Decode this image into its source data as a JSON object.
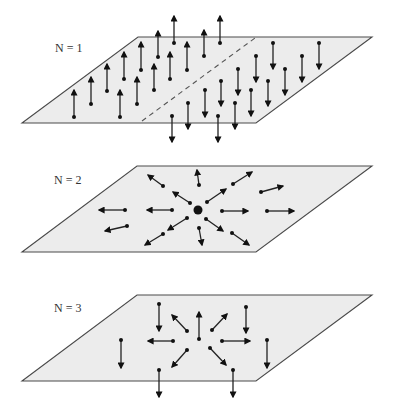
{
  "figure": {
    "colors": {
      "plane_fill": "#ececec",
      "plane_edge": "#4a4a4a",
      "arrow": "#222222",
      "background": "#ffffff"
    },
    "panels": [
      {
        "id": "n1",
        "label": "N = 1",
        "label_pos": [
          55,
          52
        ],
        "plane": [
          [
            138,
            37
          ],
          [
            372,
            37
          ],
          [
            256,
            123
          ],
          [
            22,
            123
          ]
        ],
        "dashed_line": [
          [
            142,
            121
          ],
          [
            255,
            38
          ]
        ],
        "center_dot": null,
        "arrows": [
          [
            [
              74,
              117
            ],
            [
              74,
              90
            ]
          ],
          [
            [
              91,
              104
            ],
            [
              91,
              77
            ]
          ],
          [
            [
              107,
              91
            ],
            [
              107,
              64
            ]
          ],
          [
            [
              124,
              79
            ],
            [
              124,
              52
            ]
          ],
          [
            [
              120,
              117
            ],
            [
              120,
              90
            ]
          ],
          [
            [
              137,
              104
            ],
            [
              137,
              77
            ]
          ],
          [
            [
              141,
              70
            ],
            [
              141,
              42
            ]
          ],
          [
            [
              154,
              90
            ],
            [
              154,
              64
            ]
          ],
          [
            [
              158,
              57
            ],
            [
              158,
              31
            ]
          ],
          [
            [
              170,
              79
            ],
            [
              170,
              52
            ]
          ],
          [
            [
              174,
              43
            ],
            [
              174,
              16
            ]
          ],
          [
            [
              187,
              70
            ],
            [
              187,
              42
            ]
          ],
          [
            [
              204,
              56
            ],
            [
              204,
              30
            ]
          ],
          [
            [
              220,
              43
            ],
            [
              220,
              16
            ]
          ],
          [
            [
              172,
              116
            ],
            [
              172,
              142
            ]
          ],
          [
            [
              188,
              103
            ],
            [
              188,
              129
            ]
          ],
          [
            [
              205,
              90
            ],
            [
              205,
              117
            ]
          ],
          [
            [
              218,
              116
            ],
            [
              218,
              142
            ]
          ],
          [
            [
              221,
              81
            ],
            [
              221,
              106
            ]
          ],
          [
            [
              235,
              103
            ],
            [
              235,
              129
            ]
          ],
          [
            [
              238,
              69
            ],
            [
              238,
              95
            ]
          ],
          [
            [
              251,
              90
            ],
            [
              251,
              116
            ]
          ],
          [
            [
              256,
              56
            ],
            [
              256,
              82
            ]
          ],
          [
            [
              268,
              81
            ],
            [
              268,
              106
            ]
          ],
          [
            [
              273,
              43
            ],
            [
              273,
              69
            ]
          ],
          [
            [
              285,
              69
            ],
            [
              285,
              95
            ]
          ],
          [
            [
              302,
              56
            ],
            [
              302,
              82
            ]
          ],
          [
            [
              319,
              43
            ],
            [
              319,
              69
            ]
          ]
        ]
      },
      {
        "id": "n2",
        "label": "N = 2",
        "label_pos": [
          54,
          184
        ],
        "plane": [
          [
            137,
            166
          ],
          [
            372,
            166
          ],
          [
            256,
            252
          ],
          [
            22,
            252
          ]
        ],
        "dashed_line": null,
        "center_dot": [
          198,
          210
        ],
        "arrows": [
          [
            [
              163,
              186
            ],
            [
              148,
              175
            ]
          ],
          [
            [
              190,
              203
            ],
            [
              173,
              192
            ]
          ],
          [
            [
              172,
              210
            ],
            [
              147,
              210
            ]
          ],
          [
            [
              125,
              210
            ],
            [
              99,
              210
            ]
          ],
          [
            [
              127,
              226
            ],
            [
              105,
              231
            ]
          ],
          [
            [
              187,
              218
            ],
            [
              168,
              230
            ]
          ],
          [
            [
              163,
              234
            ],
            [
              145,
              245
            ]
          ],
          [
            [
              199,
              228
            ],
            [
              202,
              245
            ]
          ],
          [
            [
              199,
              185
            ],
            [
              197,
              170
            ]
          ],
          [
            [
              207,
              202
            ],
            [
              226,
              189
            ]
          ],
          [
            [
              233,
              184
            ],
            [
              252,
              172
            ]
          ],
          [
            [
              261,
              192
            ],
            [
              283,
              186
            ]
          ],
          [
            [
              222,
              211
            ],
            [
              248,
              211
            ]
          ],
          [
            [
              267,
              211
            ],
            [
              294,
              211
            ]
          ],
          [
            [
              206,
              219
            ],
            [
              223,
              231
            ]
          ],
          [
            [
              232,
              233
            ],
            [
              249,
              245
            ]
          ]
        ]
      },
      {
        "id": "n3",
        "label": "N = 3",
        "label_pos": [
          54,
          312
        ],
        "plane": [
          [
            137,
            295
          ],
          [
            372,
            295
          ],
          [
            256,
            381
          ],
          [
            22,
            381
          ]
        ],
        "dashed_line": null,
        "center_dot": null,
        "arrows": [
          [
            [
              159,
              304
            ],
            [
              159,
              331
            ]
          ],
          [
            [
              121,
              340
            ],
            [
              121,
              368
            ]
          ],
          [
            [
              173,
              341
            ],
            [
              148,
              341
            ]
          ],
          [
            [
              187,
              331
            ],
            [
              172,
              315
            ]
          ],
          [
            [
              199,
              339
            ],
            [
              199,
              312
            ]
          ],
          [
            [
              187,
              350
            ],
            [
              172,
              367
            ]
          ],
          [
            [
              159,
              370
            ],
            [
              159,
              397
            ]
          ],
          [
            [
              212,
              330
            ],
            [
              227,
              314
            ]
          ],
          [
            [
              246,
              307
            ],
            [
              246,
              333
            ]
          ],
          [
            [
              222,
              341
            ],
            [
              250,
              341
            ]
          ],
          [
            [
              267,
              340
            ],
            [
              267,
              368
            ]
          ],
          [
            [
              210,
              348
            ],
            [
              226,
              365
            ]
          ],
          [
            [
              233,
              370
            ],
            [
              233,
              397
            ]
          ]
        ]
      }
    ]
  }
}
